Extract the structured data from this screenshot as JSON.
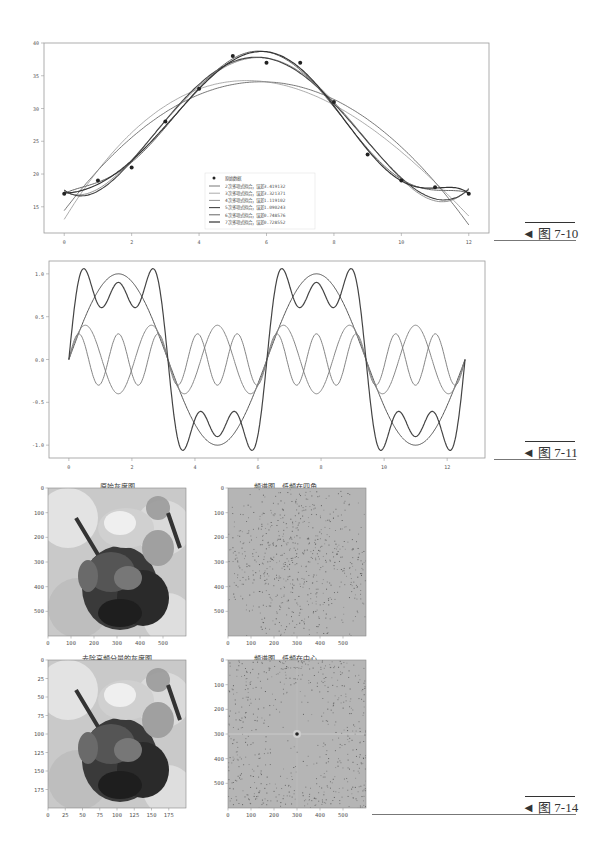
{
  "figures": [
    {
      "id": "7-10",
      "caption": "◄ 图 7-10"
    },
    {
      "id": "7-11",
      "caption": "◄ 图 7-11"
    },
    {
      "id": "7-14",
      "caption": "◄ 图 7-14"
    }
  ],
  "colors": {
    "axis": "#888888",
    "curve_dark": "#444444",
    "curve_mid": "#777777",
    "curve_light": "#999999",
    "point": "#222222"
  },
  "chart_data": [
    {
      "type": "line",
      "title": "",
      "xlabel": "",
      "ylabel": "",
      "xlim": [
        -0.6,
        12.6
      ],
      "ylim": [
        11,
        40
      ],
      "xticks": [
        0,
        2,
        4,
        6,
        8,
        10,
        12
      ],
      "yticks": [
        15,
        20,
        25,
        30,
        35,
        40
      ],
      "grid": false,
      "legend_position": "lower center",
      "points": {
        "name": "原始数据",
        "x": [
          0,
          1,
          2,
          3,
          4,
          5,
          6,
          7,
          8,
          9,
          10,
          11,
          12
        ],
        "y": [
          17,
          19,
          21,
          28,
          33,
          38,
          37,
          37,
          31,
          23,
          19,
          18,
          17
        ]
      },
      "series": [
        {
          "name": "2次多项式拟合，误差3.419132",
          "degree": 2,
          "error": 3.419132
        },
        {
          "name": "3次多项式拟合，误差3.321371",
          "degree": 3,
          "error": 3.321371
        },
        {
          "name": "4次多项式拟合，误差1.119102",
          "degree": 4,
          "error": 1.119102
        },
        {
          "name": "5次多项式拟合，误差1.090243",
          "degree": 5,
          "error": 1.090243
        },
        {
          "name": "6次多项式拟合，误差0.748576",
          "degree": 6,
          "error": 0.748576
        },
        {
          "name": "7次多项式拟合，误差0.728552",
          "degree": 7,
          "error": 0.728552
        }
      ]
    },
    {
      "type": "line",
      "title": "",
      "xlabel": "",
      "ylabel": "",
      "xlim": [
        -0.63,
        13.2
      ],
      "ylim": [
        -1.15,
        1.15
      ],
      "xticks": [
        0,
        2,
        4,
        6,
        8,
        10,
        12
      ],
      "yticks": [
        -1.0,
        -0.5,
        0.0,
        0.5,
        1.0
      ],
      "grid": false,
      "legend_position": "upper right",
      "x_range": [
        0,
        12.566
      ],
      "series": [
        {
          "name": "s1-2Hz分量",
          "amplitude": 1.0,
          "harmonic": 1
        },
        {
          "name": "s2-6Hz分量",
          "amplitude": 0.4,
          "harmonic": 3
        },
        {
          "name": "s3-10Hz分量",
          "amplitude": 0.3,
          "harmonic": 5
        },
        {
          "name": "s - 复合信号",
          "composite": true
        }
      ]
    },
    {
      "type": "heatmap",
      "title": "原始灰度图",
      "xticks": [
        0,
        100,
        200,
        300,
        400,
        500
      ],
      "yticks": [
        0,
        100,
        200,
        300,
        400,
        500
      ],
      "extent": [
        0,
        600
      ]
    },
    {
      "type": "heatmap",
      "title": "频谱图，低频在四角",
      "xticks": [
        0,
        100,
        200,
        300,
        400,
        500
      ],
      "yticks": [
        0,
        100,
        200,
        300,
        400,
        500
      ],
      "extent": [
        0,
        600
      ]
    },
    {
      "type": "heatmap",
      "title": "去除高频分量的灰度图",
      "xticks": [
        0,
        25,
        50,
        75,
        100,
        125,
        150,
        175
      ],
      "yticks": [
        0,
        25,
        50,
        75,
        100,
        125,
        150,
        175
      ],
      "extent": [
        0,
        200
      ]
    },
    {
      "type": "heatmap",
      "title": "频谱图，低频在中心",
      "xticks": [
        0,
        100,
        200,
        300,
        400,
        500
      ],
      "yticks": [
        0,
        100,
        200,
        300,
        400,
        500
      ],
      "extent": [
        0,
        600
      ]
    }
  ]
}
